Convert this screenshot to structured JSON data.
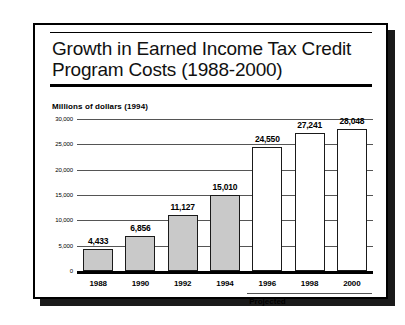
{
  "slide": {
    "title": "Growth in Earned Income Tax Credit\nProgram Costs  (1988-2000)",
    "units_label": "Millions of dollars (1994)",
    "projected_label": "Projected"
  },
  "chart_data": {
    "type": "bar",
    "title": "Growth in Earned Income Tax Credit Program Costs (1988-2000)",
    "subtitle": "Millions of dollars (1994)",
    "xlabel": "",
    "ylabel": "Millions of dollars (1994)",
    "categories": [
      "1988",
      "1990",
      "1992",
      "1994",
      "1996",
      "1998",
      "2000"
    ],
    "values": [
      4433,
      6856,
      11127,
      15010,
      24550,
      27241,
      28048
    ],
    "value_labels": [
      "4,433",
      "6,856",
      "11,127",
      "15,010",
      "24,550",
      "27,241",
      "28,048"
    ],
    "bar_styles": [
      "filled",
      "filled",
      "filled",
      "filled",
      "hollow",
      "hollow",
      "hollow"
    ],
    "ylim": [
      0,
      30000
    ],
    "ytick_values": [
      0,
      5000,
      10000,
      15000,
      20000,
      25000,
      30000
    ],
    "ytick_labels": [
      "0",
      "5,000",
      "10,000",
      "15,000",
      "20,000",
      "25,000",
      "30,000"
    ],
    "grid": true,
    "legend": false,
    "annotations": [
      {
        "text": "Projected",
        "spans_categories": [
          "1996",
          "1998",
          "2000"
        ]
      }
    ],
    "colors": {
      "actual_bar_fill": "#c9c9c9",
      "projected_bar_fill": "#ffffff",
      "bar_outline": "#1a1a1a",
      "gridline": "#555555",
      "axis": "#000000",
      "text": "#000000"
    }
  }
}
